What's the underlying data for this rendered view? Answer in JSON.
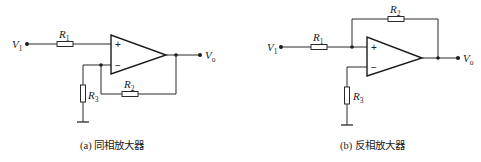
{
  "diagram": {
    "panels": [
      {
        "id": "a",
        "caption": "(a) 同相放大器",
        "input_label": {
          "main": "V",
          "sub": "1"
        },
        "output_label": {
          "main": "V",
          "sub": "o"
        },
        "plus_sign": "+",
        "minus_sign": "−",
        "resistors": [
          {
            "main": "R",
            "sub": "1"
          },
          {
            "main": "R",
            "sub": "2"
          },
          {
            "main": "R",
            "sub": "3"
          }
        ]
      },
      {
        "id": "b",
        "caption": "(b) 反相放大器",
        "input_label": {
          "main": "V",
          "sub": "1"
        },
        "output_label": {
          "main": "V",
          "sub": "o"
        },
        "plus_sign": "+",
        "minus_sign": "−",
        "resistors": [
          {
            "main": "R",
            "sub": "1"
          },
          {
            "main": "R",
            "sub": "2"
          },
          {
            "main": "R",
            "sub": "3"
          }
        ]
      }
    ],
    "colors": {
      "line": "#2a2a2a",
      "background": "#ffffff"
    }
  }
}
